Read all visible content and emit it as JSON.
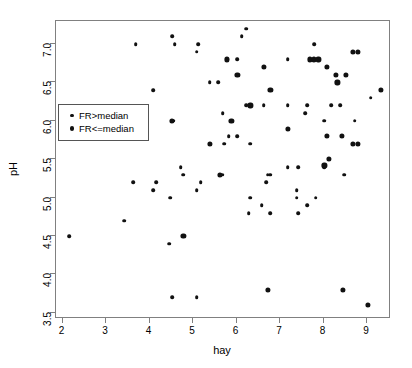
{
  "chart_data": {
    "type": "scatter",
    "title": "",
    "xlabel": "hay",
    "ylabel": "pH",
    "xlim": [
      1.85,
      9.55
    ],
    "ylim": [
      3.42,
      7.3
    ],
    "xticks": [
      2,
      3,
      4,
      5,
      6,
      7,
      8,
      9
    ],
    "xticklabels": [
      "2",
      "3",
      "4",
      "5",
      "6",
      "7",
      "8",
      "9"
    ],
    "yticks": [
      3.5,
      4.0,
      4.5,
      5.0,
      5.5,
      6.0,
      6.5,
      7.0
    ],
    "yticklabels": [
      "3.5",
      "4.0",
      "4.5",
      "5.0",
      "5.5",
      "6.0",
      "6.5",
      "7.0"
    ],
    "grid": false,
    "legend_position": "upper left",
    "series": [
      {
        "name": "FR>median",
        "marker": "small-filled-circle",
        "color": "#111111",
        "points": [
          [
            3.68,
            7.0
          ],
          [
            4.52,
            7.1
          ],
          [
            4.58,
            7.0
          ],
          [
            5.12,
            7.0
          ],
          [
            5.08,
            6.9
          ],
          [
            4.08,
            6.4
          ],
          [
            5.38,
            6.5
          ],
          [
            5.58,
            6.5
          ],
          [
            5.78,
            6.8
          ],
          [
            6.02,
            6.8
          ],
          [
            6.12,
            7.1
          ],
          [
            6.22,
            7.2
          ],
          [
            5.68,
            6.1
          ],
          [
            5.88,
            6.0
          ],
          [
            5.82,
            5.8
          ],
          [
            5.72,
            5.7
          ],
          [
            6.02,
            5.8
          ],
          [
            6.32,
            5.7
          ],
          [
            6.22,
            6.2
          ],
          [
            6.62,
            6.2
          ],
          [
            7.18,
            6.2
          ],
          [
            7.18,
            6.8
          ],
          [
            7.62,
            6.2
          ],
          [
            7.58,
            6.1
          ],
          [
            7.78,
            7.0
          ],
          [
            8.02,
            6.0
          ],
          [
            8.18,
            6.2
          ],
          [
            8.38,
            6.2
          ],
          [
            8.72,
            6.0
          ],
          [
            9.08,
            6.3
          ],
          [
            4.55,
            6.0
          ],
          [
            3.62,
            5.2
          ],
          [
            4.08,
            5.1
          ],
          [
            4.15,
            5.2
          ],
          [
            4.48,
            5.0
          ],
          [
            4.78,
            5.3
          ],
          [
            5.18,
            5.2
          ],
          [
            5.08,
            5.1
          ],
          [
            5.62,
            5.3
          ],
          [
            5.68,
            5.3
          ],
          [
            4.72,
            5.4
          ],
          [
            6.72,
            5.3
          ],
          [
            6.78,
            5.3
          ],
          [
            6.68,
            5.2
          ],
          [
            7.18,
            5.4
          ],
          [
            7.42,
            5.4
          ],
          [
            7.38,
            5.1
          ],
          [
            8.02,
            5.4
          ],
          [
            8.48,
            5.3
          ],
          [
            3.42,
            4.7
          ],
          [
            6.28,
            4.8
          ],
          [
            6.78,
            4.8
          ],
          [
            6.58,
            4.9
          ],
          [
            7.38,
            5.0
          ],
          [
            7.62,
            4.9
          ],
          [
            6.32,
            5.0
          ],
          [
            7.82,
            5.0
          ],
          [
            7.42,
            4.8
          ],
          [
            2.15,
            4.5
          ],
          [
            4.45,
            4.4
          ],
          [
            4.52,
            3.7
          ],
          [
            5.08,
            3.7
          ]
        ]
      },
      {
        "name": "FR<=median",
        "marker": "large-filled-circle",
        "color": "#111111",
        "points": [
          [
            5.88,
            6.0
          ],
          [
            6.02,
            6.6
          ],
          [
            6.32,
            6.2
          ],
          [
            6.62,
            6.7
          ],
          [
            6.78,
            6.4
          ],
          [
            7.68,
            6.8
          ],
          [
            7.78,
            6.8
          ],
          [
            7.88,
            6.8
          ],
          [
            8.08,
            6.7
          ],
          [
            8.28,
            6.6
          ],
          [
            8.32,
            6.5
          ],
          [
            8.52,
            6.6
          ],
          [
            8.68,
            6.9
          ],
          [
            8.78,
            6.9
          ],
          [
            9.32,
            6.4
          ],
          [
            8.08,
            5.8
          ],
          [
            8.42,
            5.8
          ],
          [
            8.68,
            5.7
          ],
          [
            8.78,
            5.7
          ],
          [
            8.12,
            5.5
          ],
          [
            8.02,
            5.42
          ],
          [
            7.18,
            5.9
          ],
          [
            5.78,
            6.8
          ],
          [
            4.52,
            6.0
          ],
          [
            5.62,
            5.3
          ],
          [
            5.38,
            5.7
          ],
          [
            4.78,
            4.5
          ],
          [
            6.72,
            3.8
          ],
          [
            8.45,
            3.8
          ],
          [
            9.02,
            3.6
          ]
        ]
      }
    ]
  },
  "legend": {
    "entries": [
      {
        "label": "FR>median",
        "marker": "small"
      },
      {
        "label": "FR<=median",
        "marker": "big"
      }
    ]
  },
  "axes": {
    "x_title": "hay",
    "y_title": "pH"
  }
}
